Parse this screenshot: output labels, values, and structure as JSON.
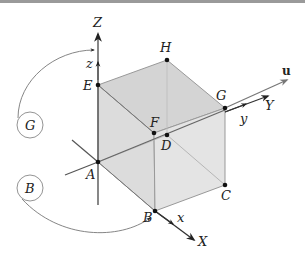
{
  "diagram": {
    "colors": {
      "face_fill": "#d9d9d9",
      "face_fill_light": "#e6e6e6",
      "edge": "#888888",
      "axis": "#555555",
      "point": "#111111",
      "arrow": "#222222",
      "top_border": "#9a9a9a"
    },
    "vertices": {
      "A": "A",
      "B": "B",
      "C": "C",
      "D": "D",
      "E": "E",
      "F": "F",
      "G": "G",
      "H": "H"
    },
    "axes": {
      "Z": "Z",
      "z": "z",
      "Y": "Y",
      "y": "y",
      "X": "X",
      "x": "x",
      "u": "u"
    },
    "rotation_circles": {
      "G": "G",
      "B": "B"
    }
  }
}
